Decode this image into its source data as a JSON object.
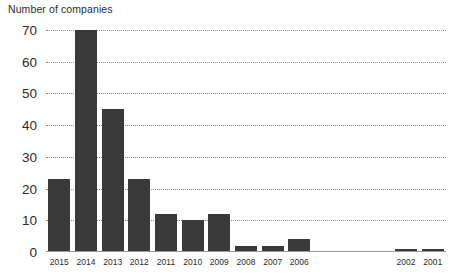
{
  "chart_data": {
    "type": "bar",
    "title": "Number of companies",
    "xlabel": "",
    "ylabel": "",
    "ylim": [
      0,
      70
    ],
    "ytick_values": [
      0,
      10,
      20,
      30,
      40,
      50,
      60,
      70
    ],
    "ytick_labels": [
      "0",
      "10",
      "20",
      "30",
      "40",
      "50",
      "60",
      "70"
    ],
    "grid": "horizontal-dotted",
    "legend": "none",
    "categories": [
      "2015",
      "2014",
      "2013",
      "2012",
      "2011",
      "2010",
      "2009",
      "2008",
      "2007",
      "2006",
      "2005",
      "2004",
      "2003",
      "2002",
      "2001"
    ],
    "values": [
      23,
      70,
      45,
      23,
      12,
      10,
      12,
      2,
      2,
      4,
      0,
      0,
      0,
      1,
      1
    ],
    "bar_color": "#3a3a3a",
    "background_color": "#ffffff",
    "gridline_color": "#8d8d8d",
    "axis_color": "#9a9a9a",
    "text_color": "#2b2b2b"
  }
}
